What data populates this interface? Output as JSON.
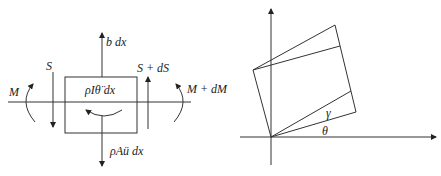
{
  "left_diagram": {
    "title": "Free body diagram of beam element",
    "labels": {
      "body_force": "b dx",
      "shear_left": "S",
      "shear_right": "S + dS",
      "moment_left": "M",
      "moment_right": "M + dM",
      "rotary_inertia": "ρIθ̈ dx",
      "translational_inertia": "ρAü dx"
    }
  },
  "right_diagram": {
    "title": "Deformed element geometry",
    "labels": {
      "shear_angle": "γ",
      "rotation_angle": "θ"
    }
  },
  "colors": {
    "stroke": "#333333",
    "text": "#222222",
    "background": "#ffffff"
  }
}
